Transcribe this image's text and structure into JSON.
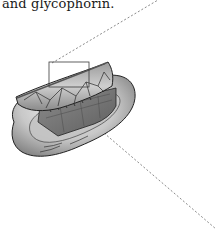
{
  "caption": {
    "text": "and glycophorin."
  },
  "figure": {
    "callout_box": {
      "x": 49,
      "y": 62,
      "width": 40,
      "height": 25
    },
    "callout_lines": [
      {
        "x1": 52,
        "y1": 63,
        "x2": 158,
        "y2": 0
      },
      {
        "x1": 104,
        "y1": 133,
        "x2": 216,
        "y2": 229
      }
    ],
    "colors": {
      "cell_light": "#e4e4e4",
      "cell_mid": "#b9b9b9",
      "cell_dark": "#6f6f6f",
      "outline": "#222222",
      "dash": "#8a8a8a"
    }
  }
}
